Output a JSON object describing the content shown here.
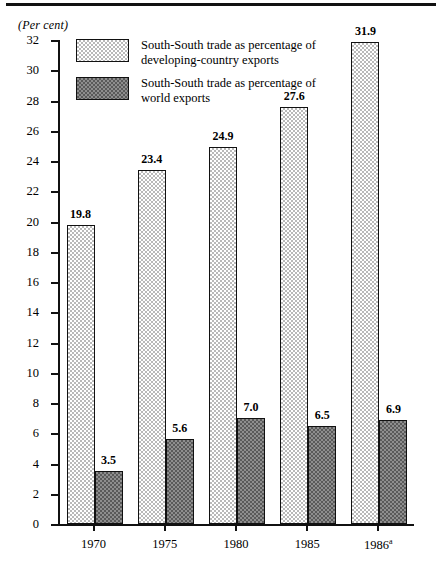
{
  "figure": {
    "axis_title": "(Per cent)",
    "top_rule": true
  },
  "legend": {
    "items": [
      {
        "swatch": "light-dotted-swatch",
        "label": "South-South trade as percentage of\ndeveloping-country exports"
      },
      {
        "swatch": "dark-dotted-swatch",
        "label": "South-South trade as percentage of\nworld exports"
      }
    ]
  },
  "chart_data": {
    "type": "bar",
    "title": "",
    "subtitle": "",
    "xlabel": "",
    "ylabel": "(Per cent)",
    "ylim": [
      0,
      32
    ],
    "yticks": [
      0,
      2,
      4,
      6,
      8,
      10,
      12,
      14,
      16,
      18,
      20,
      22,
      24,
      26,
      28,
      30,
      32
    ],
    "ytick_labels": [
      "0",
      "2",
      "4",
      "6",
      "8",
      "10",
      "12",
      "14",
      "16",
      "18",
      "20",
      "22",
      "24",
      "26",
      "28",
      "30",
      "32"
    ],
    "categories": [
      "1970",
      "1975",
      "1980",
      "1985",
      "1986"
    ],
    "category_labels": [
      "1970",
      "1975",
      "1980",
      "1985",
      "1986a"
    ],
    "category_label_sup": [
      "",
      "",
      "",
      "",
      "a"
    ],
    "grid": false,
    "legend_position": "upper-left-inside",
    "series": [
      {
        "name": "South-South trade as percentage of developing-country exports",
        "style": "light-dotted",
        "values": [
          19.8,
          23.4,
          24.9,
          27.6,
          31.9
        ],
        "value_labels": [
          "19.8",
          "23.4",
          "24.9",
          "27.6",
          "31.9"
        ]
      },
      {
        "name": "South-South trade as percentage of world exports",
        "style": "dark-dotted",
        "values": [
          3.5,
          5.6,
          7.0,
          6.5,
          6.9
        ],
        "value_labels": [
          "3.5",
          "5.6",
          "7.0",
          "6.5",
          "6.9"
        ]
      }
    ]
  },
  "colors": {
    "axis": "#111111",
    "light_fill": "#b9b9b9",
    "dark_fill": "#5a5a5a",
    "background": "#ffffff"
  }
}
